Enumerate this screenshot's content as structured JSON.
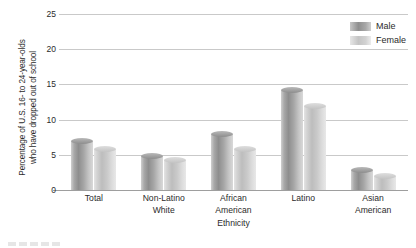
{
  "chart_data": {
    "type": "bar",
    "title": "",
    "xlabel": "Ethnicity",
    "ylabel": "Percentage of U.S. 16- to 24-year-olds who have dropped out of school",
    "categories": [
      "Total",
      "Non-Latino White",
      "African American",
      "Latino",
      "Asian American"
    ],
    "series": [
      {
        "name": "Male",
        "color": "#9a9a9a",
        "values": [
          7.0,
          4.9,
          7.9,
          14.2,
          2.8
        ]
      },
      {
        "name": "Female",
        "color": "#c8c8c8",
        "values": [
          5.8,
          4.2,
          5.8,
          12.0,
          2.0
        ]
      }
    ],
    "ylim": [
      0,
      25
    ],
    "yticks": [
      0,
      5,
      10,
      15,
      20,
      25
    ],
    "grid": true,
    "legend_position": "top-right"
  },
  "axis": {
    "y_title_line1": "Percentage of U.S. 16- to 24-year-olds",
    "y_title_line2": "who have dropped out of school",
    "x_title": "Ethnicity",
    "ytick_labels": [
      "0",
      "5",
      "10",
      "15",
      "20",
      "25"
    ]
  },
  "categories": [
    {
      "line1": "Total",
      "line2": ""
    },
    {
      "line1": "Non-Latino",
      "line2": "White"
    },
    {
      "line1": "African",
      "line2": "American"
    },
    {
      "line1": "Latino",
      "line2": ""
    },
    {
      "line1": "Asian",
      "line2": "American"
    }
  ],
  "legend": {
    "items": [
      {
        "label": "Male"
      },
      {
        "label": "Female"
      }
    ]
  }
}
